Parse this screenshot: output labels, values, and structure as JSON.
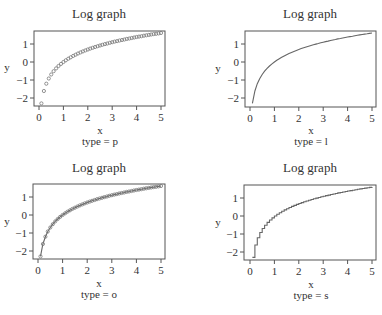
{
  "chart_data": [
    {
      "type": "scatter",
      "plot_type_code": "p",
      "title": "Log graph",
      "xlabel": "x",
      "ylabel": "y",
      "caption": "type = p",
      "xlim": [
        0,
        5
      ],
      "ylim": [
        -2.5,
        1.75
      ],
      "xticks": [
        0,
        1,
        2,
        3,
        4,
        5
      ],
      "yticks": [
        -2,
        -1,
        0,
        1
      ],
      "grid": false,
      "marker": "open-circle",
      "function": "y = ln(x)",
      "x_range": {
        "start": 0.1,
        "end": 5.0,
        "step": 0.1
      }
    },
    {
      "type": "line",
      "plot_type_code": "l",
      "title": "Log graph",
      "xlabel": "x",
      "ylabel": "y",
      "caption": "type = l",
      "xlim": [
        0,
        5
      ],
      "ylim": [
        -2.5,
        1.75
      ],
      "xticks": [
        0,
        1,
        2,
        3,
        4,
        5
      ],
      "yticks": [
        -2,
        -1,
        0,
        1
      ],
      "grid": false,
      "function": "y = ln(x)",
      "x_range": {
        "start": 0.1,
        "end": 5.0,
        "step": 0.1
      }
    },
    {
      "type": "line",
      "plot_type_code": "o",
      "title": "Log graph",
      "xlabel": "x",
      "ylabel": "y",
      "caption": "type = o",
      "xlim": [
        0,
        5
      ],
      "ylim": [
        -2.5,
        1.75
      ],
      "xticks": [
        0,
        1,
        2,
        3,
        4,
        5
      ],
      "yticks": [
        -2,
        -1,
        0,
        1
      ],
      "grid": false,
      "marker": "open-circle",
      "function": "y = ln(x)",
      "x_range": {
        "start": 0.1,
        "end": 5.0,
        "step": 0.1
      }
    },
    {
      "type": "line",
      "plot_type_code": "s",
      "title": "Log graph",
      "xlabel": "x",
      "ylabel": "y",
      "caption": "type = s",
      "xlim": [
        0,
        5
      ],
      "ylim": [
        -2.5,
        1.75
      ],
      "xticks": [
        0,
        1,
        2,
        3,
        4,
        5
      ],
      "yticks": [
        -2,
        -1,
        0,
        1
      ],
      "grid": false,
      "step": true,
      "function": "y = ln(x)",
      "x_range": {
        "start": 0.1,
        "end": 5.0,
        "step": 0.1
      }
    }
  ],
  "panels": [
    {
      "title": "Log graph",
      "xlabel": "x",
      "ylabel": "y",
      "caption": "type = p"
    },
    {
      "title": "Log graph",
      "xlabel": "x",
      "ylabel": "y",
      "caption": "type = l"
    },
    {
      "title": "Log graph",
      "xlabel": "x",
      "ylabel": "y",
      "caption": "type = o"
    },
    {
      "title": "Log graph",
      "xlabel": "x",
      "ylabel": "y",
      "caption": "type = s"
    }
  ],
  "colors": {
    "frame": "#555555",
    "series": "#666666",
    "text": "#333333",
    "background": "#ffffff"
  }
}
